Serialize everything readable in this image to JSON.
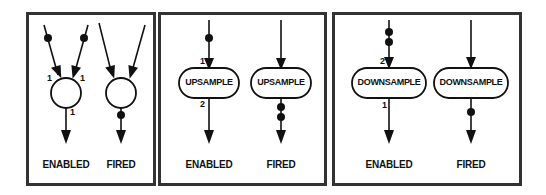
{
  "figure": {
    "panels": [
      {
        "id": "sdf-actor",
        "enabled": {
          "label": "ENABLED",
          "node": "circle",
          "input_rates": [
            "1",
            "1"
          ],
          "output_rate": "1",
          "input_tokens": [
            1,
            1
          ],
          "output_tokens": 0
        },
        "fired": {
          "label": "FIRED",
          "node": "circle",
          "input_tokens": [
            0,
            0
          ],
          "output_tokens": 1
        }
      },
      {
        "id": "upsample",
        "enabled": {
          "label": "ENABLED",
          "node_label": "UPSAMPLE",
          "input_rate": "1",
          "output_rate": "2",
          "input_tokens": 1,
          "output_tokens": 0
        },
        "fired": {
          "label": "FIRED",
          "node_label": "UPSAMPLE",
          "input_tokens": 0,
          "output_tokens": 2
        }
      },
      {
        "id": "downsample",
        "enabled": {
          "label": "ENABLED",
          "node_label": "DOWNSAMPLE",
          "input_rate": "2",
          "output_rate": "1",
          "input_tokens": 2,
          "output_tokens": 0
        },
        "fired": {
          "label": "FIRED",
          "node_label": "DOWNSAMPLE",
          "input_tokens": 0,
          "output_tokens": 1
        }
      }
    ],
    "colors": {
      "ink": "#111111",
      "border": "#333333",
      "background": "#ffffff"
    }
  }
}
